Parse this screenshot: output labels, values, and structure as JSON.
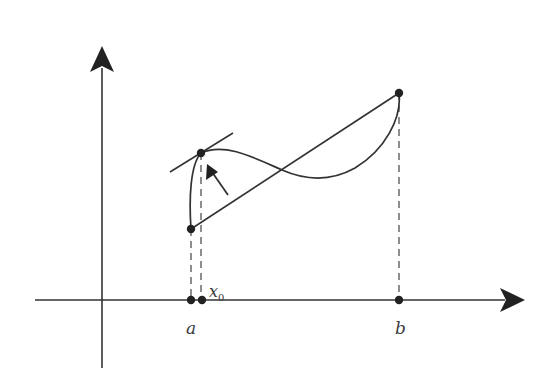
{
  "diagram": {
    "type": "mean-value-theorem-illustration",
    "colors": {
      "stroke": "#333333",
      "background": "#ffffff"
    },
    "axes": {
      "x_axis": {
        "label": ""
      },
      "y_axis": {
        "label": ""
      }
    },
    "labels": {
      "a": "a",
      "b": "b",
      "x0_base": "x",
      "x0_sub": "0"
    },
    "points": [
      {
        "name": "A",
        "description": "(a, f(a))"
      },
      {
        "name": "C",
        "description": "(x0, f(x0)) tangent point"
      },
      {
        "name": "B",
        "description": "(b, f(b))"
      }
    ],
    "elements": [
      "curve f(x) from a to b",
      "secant line from (a,f(a)) to (b,f(b))",
      "tangent line at x0",
      "arrow pointing to tangent point",
      "dashed vertical projections at a, x0, b"
    ]
  }
}
